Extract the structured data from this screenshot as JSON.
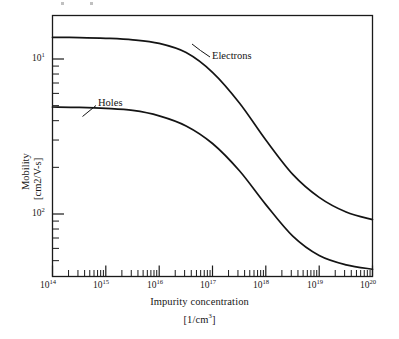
{
  "figure": {
    "background_color": "#ffffff",
    "ink_color": "#1a1a1a"
  },
  "chart_data": {
    "type": "line",
    "title": "",
    "xlabel": "Impurity concentration",
    "xlabel_units": "[1/cm3]",
    "ylabel": "Mobility",
    "ylabel_units": "[cm2/V-s]",
    "xscale": "log",
    "yscale": "log",
    "xlim": [
      100000000000000.0,
      1e+20
    ],
    "ylim": [
      30,
      2000
    ],
    "grid": false,
    "legend": "inline-annotations",
    "x_tick_labels": [
      "10¹⁴",
      "10¹⁵",
      "10¹⁶",
      "10¹⁷",
      "10¹⁸",
      "10¹⁹",
      "10²⁰"
    ],
    "x_tick_bases": [
      "10",
      "10",
      "10",
      "10",
      "10",
      "10",
      "10"
    ],
    "x_tick_exponents": [
      "14",
      "15",
      "16",
      "17",
      "18",
      "19",
      "20"
    ],
    "y_tick_bases": [
      "10",
      "10"
    ],
    "y_tick_exponents": [
      "1",
      "2"
    ],
    "y_tick_labels": [
      "10¹",
      "10²"
    ],
    "series": [
      {
        "name": "Electrons",
        "label": "Electrons",
        "x": [
          100000000000000.0,
          320000000000000.0,
          1000000000000000.0,
          3200000000000000.0,
          1e+16,
          3.2e+16,
          1e+17,
          3.2e+17,
          1e+18,
          3.2e+18,
          1e+19,
          3.2e+19,
          1e+20
        ],
        "values": [
          1380,
          1375,
          1360,
          1330,
          1260,
          1100,
          820,
          520,
          300,
          180,
          128,
          103,
          92
        ]
      },
      {
        "name": "Holes",
        "label": "Holes",
        "x": [
          100000000000000.0,
          320000000000000.0,
          1000000000000000.0,
          3200000000000000.0,
          1e+16,
          3.2e+16,
          1e+17,
          3.2e+17,
          1e+18,
          3.2e+18,
          1e+19,
          3.2e+19,
          1e+20
        ],
        "values": [
          490,
          487,
          480,
          466,
          430,
          370,
          285,
          190,
          115,
          72,
          54,
          47,
          44
        ]
      }
    ],
    "annotations": [
      {
        "text": "Electrons",
        "target_series": "Electrons"
      },
      {
        "text": "Holes",
        "target_series": "Holes"
      }
    ]
  },
  "axes": {
    "x_title_line1": "Impurity concentration",
    "x_title_line2_prefix": "[1/cm",
    "x_title_line2_exponent": "3",
    "x_title_line2_suffix": "]",
    "y_title_line1": "Mobility",
    "y_title_line2": "[cm2/V-s]"
  },
  "annotations": {
    "electrons_label": "Electrons",
    "holes_label": "Holes"
  }
}
